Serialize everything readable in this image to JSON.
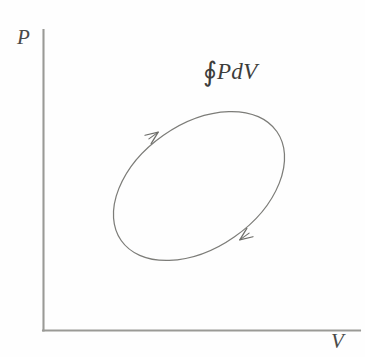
{
  "figure": {
    "background_color": "#fefefe",
    "axis_color": "#9a9a96",
    "curve_color": "#7c7c78",
    "text_color": "#3d3d3b"
  },
  "axes": {
    "y_axis": {
      "label": "P",
      "name": "pressure",
      "x": 43,
      "y_top": 30,
      "y_bottom": 330
    },
    "x_axis": {
      "label": "V",
      "name": "volume",
      "y": 330,
      "x_left": 43,
      "x_right": 360
    }
  },
  "annotation": {
    "integral_symbol": "∮",
    "integrand": "PdV",
    "full_text": "∮PdV",
    "meaning": "net work per cycle"
  },
  "chart_data": {
    "type": "line",
    "title": "",
    "xlabel": "V",
    "ylabel": "P",
    "grid": false,
    "legend": null,
    "annotations": [
      {
        "text": "∮PdV",
        "x": 205,
        "y": 60
      }
    ],
    "series": [
      {
        "name": "closed-cycle",
        "shape": "ellipse",
        "closed": true,
        "direction": "counterclockwise",
        "center": [
          199,
          186
        ],
        "semi_major": 95,
        "semi_minor": 62,
        "rotation_deg": -35,
        "arrow_markers": [
          {
            "name": "upper-left-arrow",
            "at": [
              157,
              133
            ],
            "angle_deg": -36
          },
          {
            "name": "lower-right-arrow",
            "at": [
              241,
              239
            ],
            "angle_deg": 144
          }
        ]
      }
    ]
  }
}
